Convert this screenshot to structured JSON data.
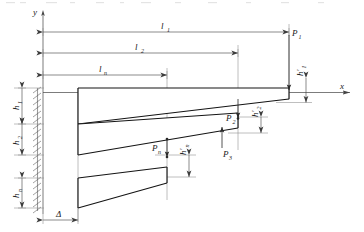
{
  "figure": {
    "type": "engineering-diagram",
    "axes": {
      "y_label": "y",
      "x_label": "x"
    },
    "horizontal_dimensions": [
      {
        "id": "l1",
        "label": "l",
        "sub": "1"
      },
      {
        "id": "l2",
        "label": "l",
        "sub": "2"
      },
      {
        "id": "ln",
        "label": "l",
        "sub": "n"
      },
      {
        "id": "delta",
        "label": "Δ",
        "sub": ""
      }
    ],
    "vertical_dimensions": [
      {
        "id": "h1",
        "label": "h",
        "sub": "1"
      },
      {
        "id": "h2",
        "label": "h",
        "sub": "2"
      },
      {
        "id": "hn",
        "label": "h",
        "sub": "n"
      },
      {
        "id": "h1p",
        "label": "h′",
        "sub": "1"
      },
      {
        "id": "h2p",
        "label": "h′",
        "sub": "2"
      },
      {
        "id": "hnp",
        "label": "h′",
        "sub": "n"
      }
    ],
    "loads": [
      {
        "id": "P1",
        "label": "P",
        "sub": "1"
      },
      {
        "id": "P2",
        "label": "P",
        "sub": "2"
      },
      {
        "id": "P3",
        "label": "P",
        "sub": "3"
      },
      {
        "id": "Pn",
        "label": "P",
        "sub": "n"
      }
    ]
  }
}
